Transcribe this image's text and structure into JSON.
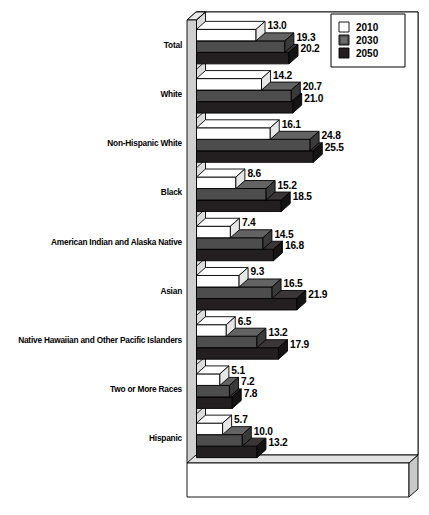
{
  "chart_data": {
    "type": "bar",
    "orientation": "horizontal",
    "title": "",
    "xlabel": "",
    "ylabel": "",
    "grid": false,
    "legend_position": "top-right",
    "xlim": [
      0,
      27
    ],
    "categories": [
      "Total",
      "White",
      "Non-Hispanic White",
      "Black",
      "American Indian and Alaska Native",
      "Asian",
      "Native Hawaiian and Other Pacific Islanders",
      "Two or More Races",
      "Hispanic"
    ],
    "series": [
      {
        "name": "2010",
        "color": "#ffffff",
        "values": [
          13.0,
          14.2,
          16.1,
          8.6,
          7.4,
          9.3,
          6.5,
          5.1,
          5.7
        ],
        "labels": [
          "13.0",
          "14.2",
          "16.1",
          "8.6",
          "7.4",
          "9.3",
          "6.5",
          "5.1",
          "5.7"
        ]
      },
      {
        "name": "2030",
        "color": "#4d4d4d",
        "values": [
          19.3,
          20.7,
          24.8,
          15.2,
          14.5,
          16.5,
          13.2,
          7.2,
          10.0
        ],
        "labels": [
          "19.3",
          "20.7",
          "24.8",
          "15.2",
          "14.5",
          "16.5",
          "13.2",
          "7.2",
          "10.0"
        ]
      },
      {
        "name": "2050",
        "color": "#231f20",
        "values": [
          20.2,
          21.0,
          25.5,
          18.5,
          16.8,
          21.9,
          17.9,
          7.8,
          13.2
        ],
        "labels": [
          "20.2",
          "21.0",
          "25.5",
          "18.5",
          "16.8",
          "21.9",
          "17.9",
          "7.8",
          "13.2"
        ]
      }
    ]
  },
  "legend": {
    "entries": [
      {
        "label": "2010",
        "swatch": "white-swatch"
      },
      {
        "label": "2030",
        "swatch": "gray-swatch"
      },
      {
        "label": "2050",
        "swatch": "black-swatch"
      }
    ]
  },
  "colors": {
    "series_2010": "#ffffff",
    "series_2030": "#4d4d4d",
    "series_2050": "#231f20",
    "wall": "#cfcfcf",
    "floor": "#e3e3e3",
    "outline": "#000000"
  }
}
